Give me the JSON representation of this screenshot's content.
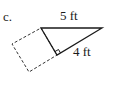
{
  "figure": {
    "part_label": "c.",
    "side_labels": {
      "top": "5 ft",
      "leg": "4 ft"
    },
    "colors": {
      "stroke": "#1a1a1a",
      "dashed_stroke": "#333333",
      "background": "#ffffff"
    },
    "shapes": {
      "triangle": {
        "type": "right-triangle",
        "vertices": [
          [
            41,
            28
          ],
          [
            102,
            28
          ],
          [
            57,
            55
          ]
        ],
        "right_angle_at": [
          57,
          55
        ]
      },
      "square": {
        "type": "dashed-square",
        "vertices": [
          [
            41,
            28
          ],
          [
            57,
            55
          ],
          [
            29,
            72
          ],
          [
            12,
            44
          ]
        ]
      }
    }
  }
}
